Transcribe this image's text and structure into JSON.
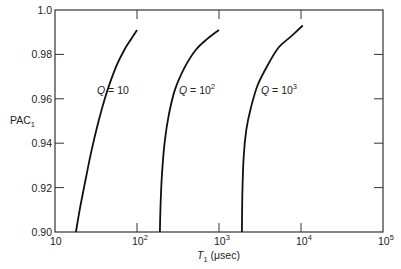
{
  "chart_data": {
    "type": "line",
    "title": "",
    "xlabel": "T1 (μsec)",
    "xlabel_parts": {
      "symbol": "T",
      "subscript": "1",
      "unit": "(μsec)"
    },
    "ylabel": "PAC1",
    "ylabel_parts": {
      "main": "PAC",
      "subscript": "1"
    },
    "xscale": "log",
    "xlim": [
      10,
      100000
    ],
    "ylim": [
      0.9,
      1.0
    ],
    "grid": false,
    "legend": null,
    "x_ticks": [
      {
        "value": 10,
        "base": "10",
        "exp": ""
      },
      {
        "value": 100,
        "base": "10",
        "exp": "2"
      },
      {
        "value": 1000,
        "base": "10",
        "exp": "3"
      },
      {
        "value": 10000,
        "base": "10",
        "exp": "4"
      },
      {
        "value": 100000,
        "base": "10",
        "exp": "5"
      }
    ],
    "y_ticks": [
      {
        "value": 0.9,
        "label": "0.90"
      },
      {
        "value": 0.92,
        "label": "0.92"
      },
      {
        "value": 0.94,
        "label": "0.94"
      },
      {
        "value": 0.96,
        "label": "0.96"
      },
      {
        "value": 0.98,
        "label": "0.98"
      },
      {
        "value": 1.0,
        "label": "1.0"
      }
    ],
    "series": [
      {
        "name": "Q = 10",
        "label_base": "Q = 10",
        "label_exp": "",
        "label_pos": {
          "x": 100,
          "y": 0.964
        },
        "x": [
          18,
          20,
          24,
          28,
          34,
          42,
          55,
          70,
          85,
          100
        ],
        "y": [
          0.9,
          0.91,
          0.925,
          0.937,
          0.95,
          0.962,
          0.974,
          0.982,
          0.987,
          0.991
        ]
      },
      {
        "name": "Q = 10^2",
        "label_base": "Q = 10",
        "label_exp": "2",
        "label_pos": {
          "x": 1000,
          "y": 0.964
        },
        "x": [
          190,
          195,
          205,
          220,
          245,
          290,
          380,
          520,
          720,
          1000
        ],
        "y": [
          0.9,
          0.915,
          0.93,
          0.942,
          0.953,
          0.964,
          0.974,
          0.982,
          0.987,
          0.991
        ]
      },
      {
        "name": "Q = 10^3",
        "label_base": "Q = 10",
        "label_exp": "3",
        "label_pos": {
          "x": 10000,
          "y": 0.964
        },
        "x": [
          1900,
          1930,
          2000,
          2150,
          2450,
          2950,
          3900,
          5300,
          7500,
          10500
        ],
        "y": [
          0.9,
          0.918,
          0.934,
          0.946,
          0.956,
          0.966,
          0.975,
          0.983,
          0.988,
          0.993
        ]
      }
    ]
  }
}
